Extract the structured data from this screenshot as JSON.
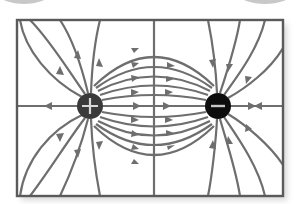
{
  "diagram": {
    "title": "Electric field lines between a positive and a negative charge",
    "line_color": "#6e6e6e",
    "frame_color": "#5a5a5a",
    "background": "#ffffff",
    "charges": [
      {
        "id": "positive",
        "symbol": "+",
        "x": 90,
        "y": 106,
        "r": 13,
        "fill": "#3a3a3a",
        "symbol_color": "#d8d8d8"
      },
      {
        "id": "negative",
        "symbol": "−",
        "x": 218,
        "y": 106,
        "r": 13,
        "fill": "#0d0d0d",
        "symbol_color": "#c8c8c8"
      }
    ],
    "frame": {
      "x": 17,
      "y": 20,
      "width": 266,
      "height": 176
    },
    "axis_lines": {
      "horizontal_y": 106,
      "vertical_x": 154
    }
  }
}
